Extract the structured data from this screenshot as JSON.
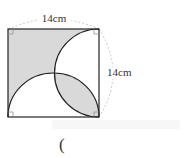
{
  "figure": {
    "top_side_label": "14cm",
    "right_side_label": "14cm",
    "answer_paren": "(",
    "colors": {
      "shade": "#d9d9d9",
      "stroke": "#222222",
      "dashed": "#bbbbbb",
      "right_angle": "#888888"
    }
  }
}
